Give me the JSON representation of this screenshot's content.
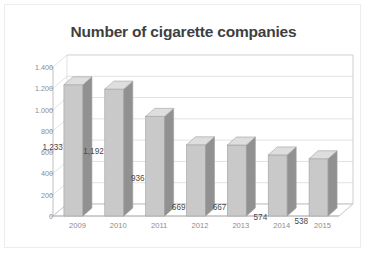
{
  "chart_data": {
    "type": "bar",
    "title": "Number of cigarette companies",
    "xlabel": "",
    "ylabel": "",
    "categories": [
      "2009",
      "2010",
      "2011",
      "2012",
      "2013",
      "2014",
      "2015"
    ],
    "values": [
      1233,
      1192,
      936,
      669,
      667,
      574,
      538
    ],
    "value_labels": [
      "1,233",
      "1,192",
      "936",
      "669",
      "667",
      "574",
      "538"
    ],
    "ytick_labels": [
      "0",
      "200",
      "400",
      "600",
      "800",
      "1.000",
      "1.200",
      "1.400"
    ],
    "ytick_values": [
      0,
      200,
      400,
      600,
      800,
      1000,
      1200,
      1400
    ],
    "ylim": [
      0,
      1400
    ],
    "grid": true,
    "legend": false,
    "style": "3d-column",
    "colors": {
      "bar_front": "#c9c9c9",
      "bar_side": "#919191",
      "bar_top": "#dedede",
      "bar_outline": "#a0a0a0",
      "gridline": "#d6d6d6",
      "axis": "#b0b0b0",
      "title_text": "#3f3f3f",
      "tick_text": "#8c8c8c",
      "label_text": "#4a4a4a",
      "frame_border": "#ececec",
      "background": "#ffffff"
    }
  }
}
